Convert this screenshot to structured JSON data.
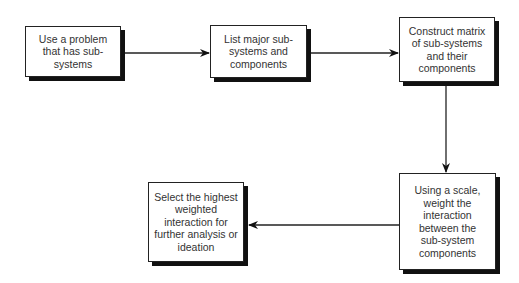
{
  "diagram": {
    "type": "flowchart",
    "steps": [
      {
        "id": "step1",
        "label": "Use a problem that has sub-systems"
      },
      {
        "id": "step2",
        "label": "List major sub-systems and components"
      },
      {
        "id": "step3",
        "label": "Construct matrix of sub-systems and their components"
      },
      {
        "id": "step4",
        "label": "Using a scale, weight the interaction between the sub-system components"
      },
      {
        "id": "step5",
        "label": "Select the highest weighted interaction for further analysis or ideation"
      }
    ],
    "edges": [
      {
        "from": "step1",
        "to": "step2"
      },
      {
        "from": "step2",
        "to": "step3"
      },
      {
        "from": "step3",
        "to": "step4"
      },
      {
        "from": "step4",
        "to": "step5"
      }
    ],
    "colors": {
      "border": "#222222",
      "shadow": "#111111",
      "text": "#333333",
      "background": "#ffffff"
    }
  }
}
